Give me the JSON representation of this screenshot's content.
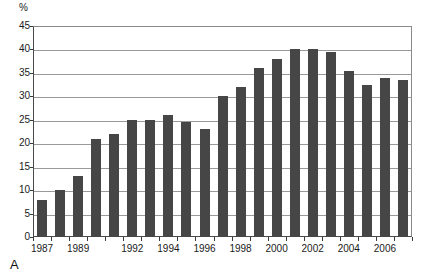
{
  "figure": {
    "letter": "A",
    "unit_label": "%"
  },
  "chart_data": {
    "type": "bar",
    "title": "",
    "xlabel": "",
    "ylabel": "%",
    "ylim": [
      0,
      45
    ],
    "ytick_step": 5,
    "grid": true,
    "legend": "none",
    "bar_color": "#464646",
    "categories": [
      "1987",
      "1988",
      "1989",
      "1990",
      "1991",
      "1992",
      "1993",
      "1994",
      "1995",
      "1996",
      "1997",
      "1998",
      "1999",
      "2000",
      "2001",
      "2002",
      "2003",
      "2004",
      "2005",
      "2006",
      "2007"
    ],
    "values": [
      8,
      10,
      13,
      21,
      22,
      25,
      25,
      26,
      24.5,
      23,
      30,
      32,
      36,
      38,
      40,
      40,
      39.5,
      35.5,
      32.5,
      34,
      33.5
    ],
    "yticks": [
      "0",
      "5",
      "10",
      "15",
      "20",
      "25",
      "30",
      "35",
      "40",
      "45"
    ],
    "xtick_labels": [
      {
        "label": "1987",
        "category": "1987"
      },
      {
        "label": "1989",
        "category": "1989"
      },
      {
        "label": "1992",
        "category": "1992"
      },
      {
        "label": "1994",
        "category": "1994"
      },
      {
        "label": "1996",
        "category": "1996"
      },
      {
        "label": "1998",
        "category": "1998"
      },
      {
        "label": "2000",
        "category": "2000"
      },
      {
        "label": "2002",
        "category": "2002"
      },
      {
        "label": "2004",
        "category": "2004"
      },
      {
        "label": "2006",
        "category": "2006"
      }
    ]
  }
}
